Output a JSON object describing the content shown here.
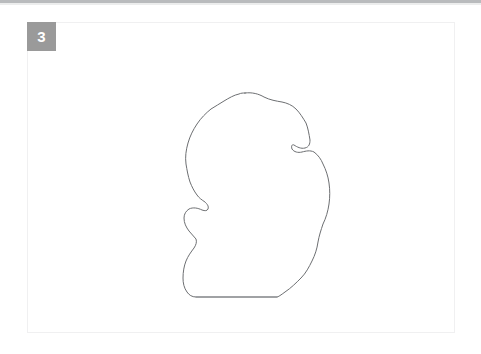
{
  "page": {
    "background_color": "#ffffff",
    "width": 481,
    "height": 354
  },
  "top_strip": {
    "color": "#b9bbbd"
  },
  "figure_card": {
    "border_color": "#f0f0f1",
    "background_color": "#ffffff"
  },
  "panel": {
    "badge_label": "3",
    "badge_color": "#9a9a9a",
    "badge_text_color": "#ffffff"
  },
  "annotation": {
    "name": "hand-drawn-contour",
    "stroke_color": "#6d6f72",
    "stroke_width": 1,
    "fill": "none",
    "closed": true,
    "bounds": {
      "x": 183,
      "y": 92,
      "width": 147,
      "height": 206
    },
    "path": "M245,93 C252,92 259,94 264,97 C270,100 276,101 282,102 C287,103 292,105 296,109 C300,113 303,118 306,123 C308,128 309,134 310,140 C310,144 309,147 305,148 C301,149 297,147 294,145 C292,144 291,146 292,149 C294,152 298,153 302,152 C306,151 310,150 314,152 C318,155 321,159 323,164 C326,170 328,176 329,183 C330,190 330,197 329,204 C328,211 326,218 323,224 C321,230 319,236 318,242 C317,249 315,255 312,261 C309,267 306,273 301,278 C296,283 291,288 285,292 C281,295 278,297 277,297 L196,297 C192,297 189,295 187,292 C184,288 183,283 183,278 C183,272 184,266 186,261 C188,256 191,252 194,248 C196,245 197,242 196,239 C194,236 191,234 189,231 C186,227 184,223 184,218 C184,214 186,211 189,209 C193,207 198,208 202,210 C205,211 207,211 208,209 C209,206 207,204 205,202 C202,200 199,198 197,195 C194,191 192,187 190,182 C188,176 187,170 186,164 C185,157 186,150 188,143 C190,136 193,130 197,124 C201,118 206,113 211,109 C215,106 220,104 224,101 C229,98 234,95 239,94 C241,93 243,93 245,93 Z",
    "baseline_segment": {
      "x1": 196,
      "y1": 297,
      "x2": 277,
      "y2": 297
    }
  }
}
